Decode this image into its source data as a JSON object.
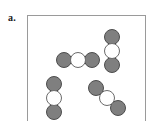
{
  "figure": {
    "panel_label": "a.",
    "caption": "",
    "frame_color": "#9a9a9a",
    "background_color": "#ffffff"
  },
  "legend": {
    "heavy_atom_color": "#7f7f7f",
    "heavy_atom_outline": "#4d4d4d",
    "light_atom_color": "#ffffff",
    "light_atom_outline": "#6b6b6b",
    "heavy_atom_name": "shaded-atom",
    "light_atom_name": "open-atom"
  },
  "chart_data": {
    "type": "scatter",
    "title": "a.",
    "xlabel": "",
    "ylabel": "",
    "xlim": [
      0,
      119
    ],
    "ylim": [
      0,
      106
    ],
    "grid": false,
    "legend_position": "none",
    "molecule_count": 4,
    "atoms_per_molecule": 3,
    "atom_diameter": 16,
    "molecules": [
      {
        "id": "molecule-top-right",
        "orientation": "vertical",
        "angle_deg": 90,
        "atoms": [
          {
            "type": "heavy",
            "cx": 84,
            "cy": 21
          },
          {
            "type": "light",
            "cx": 84,
            "cy": 35
          },
          {
            "type": "heavy",
            "cx": 84,
            "cy": 49
          }
        ]
      },
      {
        "id": "molecule-middle-left",
        "orientation": "horizontal",
        "angle_deg": 0,
        "atoms": [
          {
            "type": "heavy",
            "cx": 36,
            "cy": 44
          },
          {
            "type": "light",
            "cx": 50,
            "cy": 44
          },
          {
            "type": "heavy",
            "cx": 64,
            "cy": 44
          }
        ]
      },
      {
        "id": "molecule-bottom-left",
        "orientation": "vertical",
        "angle_deg": 90,
        "atoms": [
          {
            "type": "heavy",
            "cx": 26,
            "cy": 68
          },
          {
            "type": "light",
            "cx": 26,
            "cy": 82
          },
          {
            "type": "heavy",
            "cx": 26,
            "cy": 96
          }
        ]
      },
      {
        "id": "molecule-bottom-right",
        "orientation": "diagonal",
        "angle_deg": -45,
        "atoms": [
          {
            "type": "heavy",
            "cx": 68,
            "cy": 72
          },
          {
            "type": "light",
            "cx": 79,
            "cy": 82
          },
          {
            "type": "heavy",
            "cx": 90,
            "cy": 92
          }
        ]
      }
    ]
  }
}
